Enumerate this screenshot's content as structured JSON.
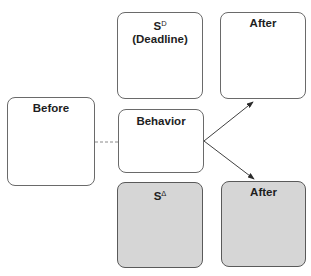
{
  "diagram": {
    "boxes": {
      "before": {
        "label": "Before",
        "shaded": false
      },
      "sd": {
        "symbol": "S",
        "superscript": "D",
        "sublabel": "(Deadline)",
        "shaded": false
      },
      "behavior": {
        "label": "Behavior",
        "shaded": false
      },
      "after_top": {
        "label": "After",
        "shaded": false
      },
      "s_delta": {
        "symbol": "S",
        "superscript": "Δ",
        "shaded": true
      },
      "after_bottom": {
        "label": "After",
        "shaded": true
      }
    },
    "connectors": [
      {
        "from": "before",
        "to": "behavior",
        "style": "dashed"
      },
      {
        "from": "behavior",
        "to": "after_top",
        "style": "arrow"
      },
      {
        "from": "behavior",
        "to": "after_bottom",
        "style": "arrow"
      }
    ],
    "colors": {
      "border": "#6a6a6a",
      "shaded_fill": "#d6d6d6",
      "text": "#1e1e1e"
    }
  }
}
